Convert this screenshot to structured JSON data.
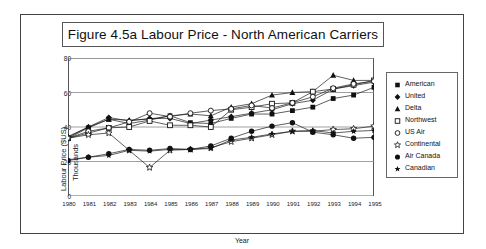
{
  "figure": {
    "title": "Figure 4.5a  Labour Price - North American Carriers",
    "xlabel": "Year",
    "ylabel_main": "Labour Price ($US)",
    "ylabel_sub": "Thousands"
  },
  "axis": {
    "yticks": [
      "0",
      "20",
      "40",
      "60",
      "80"
    ],
    "xticks": [
      "1980",
      "1981",
      "1982",
      "1983",
      "1984",
      "1985",
      "1986",
      "1987",
      "1988",
      "1989",
      "1990",
      "1991",
      "1992",
      "1993",
      "1994",
      "1995"
    ]
  },
  "legend": {
    "items": [
      {
        "label": "American",
        "marker": "filled-square-marker"
      },
      {
        "label": "United",
        "marker": "filled-diamond-marker"
      },
      {
        "label": "Delta",
        "marker": "filled-triangle-marker"
      },
      {
        "label": "Northwest",
        "marker": "open-square-marker"
      },
      {
        "label": "US Air",
        "marker": "open-circle-marker"
      },
      {
        "label": "Continental",
        "marker": "open-star-marker"
      },
      {
        "label": "Air Canada",
        "marker": "filled-circle-marker"
      },
      {
        "label": "Canadian",
        "marker": "filled-star-marker"
      }
    ]
  },
  "chart_data": {
    "type": "line",
    "title": "Figure 4.5a  Labour Price - North American Carriers",
    "xlabel": "Year",
    "ylabel": "Labour Price ($US) Thousands",
    "x": [
      1980,
      1981,
      1982,
      1983,
      1984,
      1985,
      1986,
      1987,
      1988,
      1989,
      1990,
      1991,
      1992,
      1993,
      1994,
      1995
    ],
    "ylim": [
      0,
      80
    ],
    "xlim": [
      1980,
      1995
    ],
    "yticks": [
      0,
      20,
      40,
      60,
      80
    ],
    "grid": "horizontal",
    "legend_position": "right-outside",
    "series": [
      {
        "name": "American",
        "marker": "filled-square",
        "color": "#1a1a1a",
        "values": [
          33.5,
          39.5,
          44.5,
          42.0,
          44.0,
          46.5,
          42.5,
          42.0,
          45.0,
          47.5,
          47.5,
          49.5,
          51.5,
          56.5,
          58.5,
          63.0
        ]
      },
      {
        "name": "United",
        "marker": "filled-diamond",
        "color": "#1a1a1a",
        "values": [
          34.0,
          40.0,
          45.5,
          43.5,
          45.0,
          45.0,
          42.0,
          44.0,
          46.0,
          48.0,
          50.0,
          53.5,
          55.5,
          62.0,
          64.0,
          66.0
        ]
      },
      {
        "name": "Delta",
        "marker": "filled-triangle",
        "color": "#1a1a1a",
        "values": [
          34.5,
          40.0,
          44.5,
          44.0,
          44.5,
          46.5,
          47.5,
          46.5,
          51.5,
          53.5,
          58.5,
          60.0,
          60.5,
          70.0,
          67.0,
          67.0
        ]
      },
      {
        "name": "Northwest",
        "marker": "open-square",
        "color": "#1a1a1a",
        "values": [
          33.5,
          36.5,
          39.5,
          40.0,
          43.5,
          41.0,
          41.0,
          40.0,
          50.0,
          51.5,
          53.5,
          54.0,
          60.5,
          62.0,
          64.5,
          67.0
        ]
      },
      {
        "name": "US Air",
        "marker": "open-circle",
        "color": "#1a1a1a",
        "values": [
          33.5,
          37.5,
          39.5,
          43.0,
          48.0,
          46.0,
          48.0,
          49.5,
          50.5,
          52.5,
          51.0,
          54.0,
          57.5,
          62.5,
          65.0,
          66.5
        ]
      },
      {
        "name": "Continental",
        "marker": "open-star",
        "color": "#1a1a1a",
        "values": [
          33.5,
          35.5,
          36.5,
          26.5,
          16.5,
          26.5,
          27.0,
          28.0,
          31.5,
          33.5,
          35.5,
          37.5,
          37.5,
          38.5,
          39.0,
          40.5
        ]
      },
      {
        "name": "Air Canada",
        "marker": "filled-circle",
        "color": "#1a1a1a",
        "values": [
          20.5,
          22.5,
          24.5,
          27.0,
          26.5,
          27.5,
          27.0,
          29.0,
          33.5,
          37.5,
          40.5,
          42.5,
          37.0,
          35.5,
          33.5,
          34.0
        ]
      },
      {
        "name": "Canadian",
        "marker": "filled-star",
        "color": "#1a1a1a",
        "values": [
          21.0,
          22.5,
          23.5,
          26.5,
          26.0,
          27.0,
          27.0,
          27.5,
          32.5,
          34.0,
          36.0,
          37.5,
          38.0,
          36.5,
          37.5,
          38.0
        ]
      }
    ]
  }
}
